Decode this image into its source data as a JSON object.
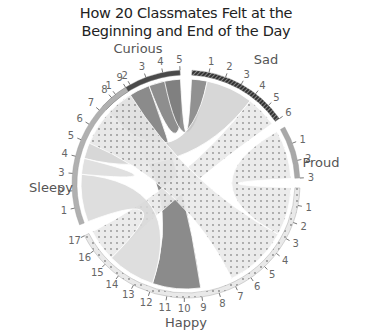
{
  "title_line1": "How 20 Classmates Felt at the",
  "title_line2": "Beginning and End of the Day",
  "chart_data": {
    "type": "chord",
    "title": "How 20 Classmates Felt at the Beginning and End of the Day",
    "groups": [
      {
        "name": "Curious",
        "size": 5,
        "ticks": [
          "1",
          "2",
          "3",
          "4",
          "5"
        ],
        "arc_color": "#555555",
        "ribbon_color": "#7a7a7a"
      },
      {
        "name": "Sad",
        "size": 6,
        "ticks": [
          "1",
          "2",
          "3",
          "4",
          "5",
          "6"
        ],
        "arc_color": "#444444",
        "ribbon_color": "#d0d0d0"
      },
      {
        "name": "Proud",
        "size": 3,
        "ticks": [
          "1",
          "2",
          "3"
        ],
        "arc_color": "#aaaaaa",
        "ribbon_color": "#e6e6e6"
      },
      {
        "name": "Happy",
        "size": 17,
        "ticks": [
          "1",
          "2",
          "3",
          "4",
          "5",
          "6",
          "7",
          "8",
          "9",
          "10",
          "11",
          "12",
          "13",
          "14",
          "15",
          "16",
          "17"
        ],
        "arc_color": "#dcdcdc",
        "ribbon_color": "#e8e8e8"
      },
      {
        "name": "Sleepy",
        "size": 9,
        "ticks": [
          "1",
          "2",
          "3",
          "4",
          "5",
          "6",
          "7",
          "8",
          "9"
        ],
        "arc_color": "#b5b5b5",
        "ribbon_color": "#d6d6d6"
      }
    ],
    "flows": [
      {
        "from": "Curious",
        "to": "Happy",
        "value": 3
      },
      {
        "from": "Curious",
        "to": "Curious",
        "value": 2
      },
      {
        "from": "Sad",
        "to": "Curious",
        "value": 1
      },
      {
        "from": "Sad",
        "to": "Sleepy",
        "value": 3
      },
      {
        "from": "Sad",
        "to": "Happy",
        "value": 2
      },
      {
        "from": "Proud",
        "to": "Happy",
        "value": 3
      },
      {
        "from": "Sleepy",
        "to": "Happy",
        "value": 4
      },
      {
        "from": "Sleepy",
        "to": "Sleepy",
        "value": 1
      }
    ],
    "total_units": 40
  }
}
